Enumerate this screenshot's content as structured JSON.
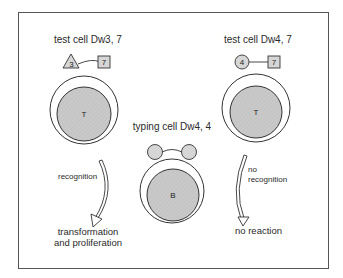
{
  "diagram": {
    "type": "immunology-schematic",
    "colors": {
      "frame": "#555555",
      "outline": "#333333",
      "nucleus_fill": "#c8c8c8",
      "marker_fill": "#d6d6d6",
      "text": "#2a2a2a",
      "background": "#ffffff"
    },
    "left_cell": {
      "title": "test cell Dw3, 7",
      "nucleus_label": "T",
      "marker_triangle": "3",
      "marker_square": "7"
    },
    "right_cell": {
      "title": "test cell Dw4, 7",
      "nucleus_label": "T",
      "marker_circle": "4",
      "marker_square": "7"
    },
    "center_cell": {
      "title": "typing cell Dw4, 4",
      "nucleus_label": "B"
    },
    "left_arrow": {
      "label": "recognition",
      "outcome_line1": "transformation",
      "outcome_line2": "and proliferation"
    },
    "right_arrow": {
      "label_line1": "no",
      "label_line2": "recognition",
      "outcome": "no reaction"
    }
  }
}
